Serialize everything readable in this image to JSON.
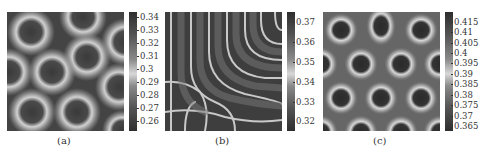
{
  "figure": {
    "panels": [
      {
        "caption": "(a)",
        "pattern": "spots-rings",
        "colorbar": {
          "ticks": [
            "0.34",
            "0.33",
            "0.32",
            "0.31",
            "0.3",
            "0.29",
            "0.28",
            "0.27",
            "0.26"
          ],
          "min": 0.255,
          "max": 0.345
        }
      },
      {
        "caption": "(b)",
        "pattern": "concentric-stripes",
        "colorbar": {
          "ticks": [
            "0.37",
            "0.36",
            "0.35",
            "0.34",
            "0.33",
            "0.32"
          ],
          "min": 0.315,
          "max": 0.375
        }
      },
      {
        "caption": "(c)",
        "pattern": "hexagonal-rings",
        "colorbar": {
          "ticks": [
            "0.415",
            "0.41",
            "0.405",
            "0.4",
            "0.395",
            "0.39",
            "0.385",
            "0.38",
            "0.375",
            "0.37",
            "0.365"
          ],
          "min": 0.364,
          "max": 0.418
        }
      }
    ],
    "colors": {
      "dark": "#2e2e2e",
      "mid": "#6a6a6a",
      "light": "#d8d8d8"
    }
  }
}
